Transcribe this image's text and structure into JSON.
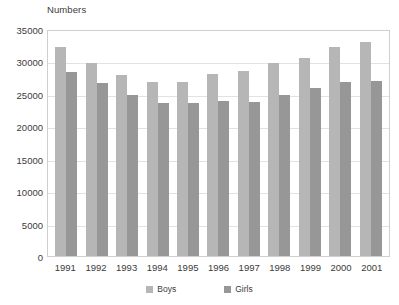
{
  "chart_data": {
    "type": "bar",
    "title": "",
    "subtitle": "",
    "xlabel": "",
    "ylabel": "Numbers",
    "ylim": [
      0,
      35000
    ],
    "ytick_step": 5000,
    "yticks": [
      "0",
      "5000",
      "10000",
      "15000",
      "20000",
      "25000",
      "30000",
      "35000"
    ],
    "ytick_values": [
      0,
      5000,
      10000,
      15000,
      20000,
      25000,
      30000,
      35000
    ],
    "grid": true,
    "legend_position": "bottom",
    "categories": [
      "1991",
      "1992",
      "1993",
      "1994",
      "1995",
      "1996",
      "1997",
      "1998",
      "1999",
      "2000",
      "2001"
    ],
    "series": [
      {
        "name": "Boys",
        "color": "#b6b6b6",
        "values": [
          32300,
          29700,
          27900,
          26800,
          26900,
          28000,
          28500,
          29800,
          30600,
          32200,
          33000
        ]
      },
      {
        "name": "Girls",
        "color": "#979797",
        "values": [
          28300,
          26700,
          24800,
          23600,
          23600,
          23900,
          23800,
          24800,
          25900,
          26800,
          27000
        ]
      }
    ]
  }
}
